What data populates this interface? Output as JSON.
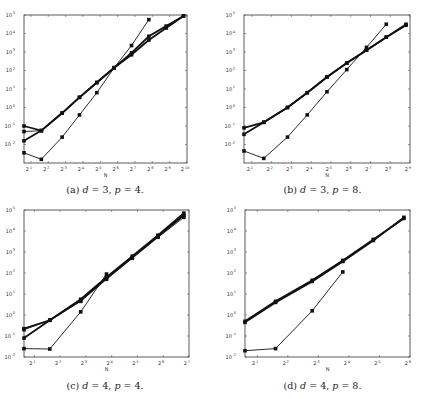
{
  "chart_data": [
    {
      "id": "a",
      "type": "line",
      "caption": "(a) d = 3, p = 4.",
      "caption_parts": {
        "label": "(a)",
        "d": "3",
        "p": "4"
      },
      "xlabel": "N",
      "ylabel": "",
      "xscale": "log2",
      "yscale": "log10",
      "xlim_exp": [
        0.6,
        10
      ],
      "ylim_exp": [
        -3,
        5
      ],
      "x_ticks_exp": [
        1,
        2,
        3,
        4,
        5,
        6,
        7,
        8,
        9,
        10
      ],
      "y_ticks_exp": [
        -2,
        -1,
        0,
        1,
        2,
        3,
        4,
        5
      ],
      "grid": false,
      "legend": null,
      "series": [
        {
          "name": "series-1",
          "style": "thin",
          "x_exp": [
            0.6,
            1.6,
            2.8,
            3.8,
            4.8,
            5.8,
            6.8,
            7.8
          ],
          "y_exp": [
            -2.45,
            -2.8,
            -1.6,
            -0.4,
            0.8,
            2.15,
            3.35,
            4.75
          ]
        },
        {
          "name": "series-2",
          "style": "thick",
          "x_exp": [
            0.6,
            1.6,
            2.8,
            3.8,
            4.8,
            5.8,
            6.8,
            7.8,
            8.8,
            9.8
          ],
          "y_exp": [
            -1.0,
            -1.25,
            -0.3,
            0.55,
            1.35,
            2.15,
            2.85,
            3.65,
            4.3,
            4.95
          ]
        },
        {
          "name": "series-3",
          "style": "thick",
          "x_exp": [
            0.6,
            1.6,
            2.8,
            3.8,
            4.8,
            5.8,
            6.8,
            7.8,
            8.8,
            9.8
          ],
          "y_exp": [
            -1.8,
            -1.25,
            -0.3,
            0.55,
            1.35,
            2.15,
            2.95,
            3.85,
            4.4,
            4.95
          ]
        },
        {
          "name": "series-4",
          "style": "thin",
          "x_exp": [
            0.6,
            1.6
          ],
          "y_exp": [
            -1.3,
            -1.25
          ]
        }
      ]
    },
    {
      "id": "b",
      "type": "line",
      "caption": "(b) d = 3, p = 8.",
      "caption_parts": {
        "label": "(b)",
        "d": "3",
        "p": "8"
      },
      "xlabel": "N",
      "ylabel": "",
      "xscale": "log2",
      "yscale": "log10",
      "xlim_exp": [
        0.6,
        9
      ],
      "ylim_exp": [
        -3,
        5
      ],
      "x_ticks_exp": [
        1,
        2,
        3,
        4,
        5,
        6,
        7,
        8,
        9
      ],
      "y_ticks_exp": [
        -2,
        -1,
        0,
        1,
        2,
        3,
        4,
        5
      ],
      "grid": false,
      "legend": null,
      "series": [
        {
          "name": "series-1",
          "style": "thin",
          "x_exp": [
            0.6,
            1.6,
            2.8,
            3.8,
            4.8,
            5.8,
            6.8,
            7.8
          ],
          "y_exp": [
            -2.35,
            -2.75,
            -1.6,
            -0.4,
            0.85,
            2.05,
            3.25,
            4.5
          ]
        },
        {
          "name": "series-2",
          "style": "thick",
          "x_exp": [
            0.6,
            1.6,
            2.8,
            3.8,
            4.8,
            5.8,
            6.8,
            7.8,
            8.8
          ],
          "y_exp": [
            -1.1,
            -0.8,
            0.0,
            0.8,
            1.65,
            2.4,
            3.1,
            3.8,
            4.5
          ]
        },
        {
          "name": "series-3",
          "style": "thick",
          "x_exp": [
            0.6,
            1.6,
            2.8,
            3.8,
            4.8,
            5.8,
            6.8,
            7.8,
            8.8
          ],
          "y_exp": [
            -1.45,
            -0.8,
            0.0,
            0.8,
            1.65,
            2.4,
            3.1,
            3.8,
            4.45
          ]
        }
      ]
    },
    {
      "id": "c",
      "type": "line",
      "caption": "(c) d = 4, p = 4.",
      "caption_parts": {
        "label": "(c)",
        "d": "4",
        "p": "4"
      },
      "xlabel": "N",
      "ylabel": "",
      "xscale": "log2",
      "yscale": "log10",
      "xlim_exp": [
        0.6,
        7
      ],
      "ylim_exp": [
        -2,
        5
      ],
      "x_ticks_exp": [
        1,
        2,
        3,
        4,
        5,
        6,
        7
      ],
      "y_ticks_exp": [
        -2,
        -1,
        0,
        1,
        2,
        3,
        4,
        5
      ],
      "grid": false,
      "legend": null,
      "series": [
        {
          "name": "series-1",
          "style": "thin",
          "x_exp": [
            0.6,
            1.6,
            2.8,
            3.8
          ],
          "y_exp": [
            -1.6,
            -1.62,
            0.15,
            1.95
          ]
        },
        {
          "name": "series-2",
          "style": "thick",
          "x_exp": [
            0.6,
            1.6,
            2.8,
            3.8,
            4.8,
            5.8,
            6.8
          ],
          "y_exp": [
            -0.65,
            -0.25,
            0.75,
            1.8,
            2.8,
            3.8,
            4.85
          ]
        },
        {
          "name": "series-3",
          "style": "thick",
          "x_exp": [
            0.6,
            1.6,
            2.8,
            3.8,
            4.8,
            5.8,
            6.8
          ],
          "y_exp": [
            -1.1,
            -0.25,
            0.7,
            1.75,
            2.75,
            3.75,
            4.75
          ]
        },
        {
          "name": "series-4",
          "style": "thin",
          "x_exp": [
            0.6,
            1.6,
            2.8,
            3.8,
            4.8,
            5.8,
            6.8
          ],
          "y_exp": [
            -0.7,
            -0.25,
            0.65,
            1.7,
            2.7,
            3.7,
            4.65
          ]
        }
      ]
    },
    {
      "id": "d",
      "type": "line",
      "caption": "(d) d = 4, p = 8.",
      "caption_parts": {
        "label": "(d)",
        "d": "4",
        "p": "8"
      },
      "xlabel": "N",
      "ylabel": "",
      "xscale": "log2",
      "yscale": "log10",
      "xlim_exp": [
        0.6,
        6
      ],
      "ylim_exp": [
        -2,
        5
      ],
      "x_ticks_exp": [
        1,
        2,
        3,
        4,
        5,
        6
      ],
      "y_ticks_exp": [
        -2,
        -1,
        0,
        1,
        2,
        3,
        4,
        5
      ],
      "grid": false,
      "legend": null,
      "series": [
        {
          "name": "series-1",
          "style": "thin",
          "x_exp": [
            0.6,
            1.6,
            2.8,
            3.8
          ],
          "y_exp": [
            -1.7,
            -1.6,
            0.2,
            2.05
          ]
        },
        {
          "name": "series-2",
          "style": "thick",
          "x_exp": [
            0.6,
            1.6,
            2.8,
            3.8,
            4.8,
            5.8
          ],
          "y_exp": [
            -0.3,
            0.65,
            1.65,
            2.6,
            3.6,
            4.6
          ]
        },
        {
          "name": "series-3",
          "style": "thick",
          "x_exp": [
            0.6,
            1.6,
            2.8,
            3.8,
            4.8,
            5.8
          ],
          "y_exp": [
            -0.35,
            0.6,
            1.6,
            2.55,
            3.55,
            4.65
          ]
        }
      ]
    }
  ],
  "panels": {
    "a": {
      "caption": "(a) d = 3, p = 4."
    },
    "b": {
      "caption": "(b) d = 3, p = 8."
    },
    "c": {
      "caption": "(c) d = 4, p = 4."
    },
    "d": {
      "caption": "(d) d = 4, p = 8."
    }
  },
  "axis": {
    "x_label": "N",
    "x_base": "2",
    "y_base": "10"
  }
}
